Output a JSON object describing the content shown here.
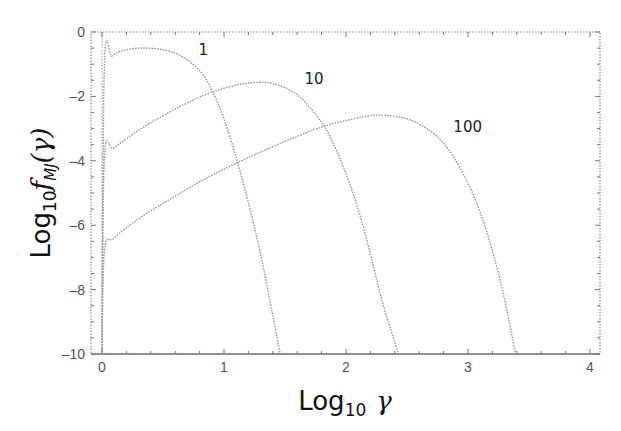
{
  "chart_data": {
    "type": "line",
    "title": "",
    "xlabel": "Log10 γ",
    "xlabel_parts": {
      "main": "Log",
      "sub": "10",
      "symbol": "γ"
    },
    "ylabel": "Log10 f_MJ(γ)",
    "ylabel_parts": {
      "main": "Log",
      "sub": "10",
      "func": "f",
      "func_sub": "MJ",
      "arg": "(γ)"
    },
    "xlim": [
      -0.1,
      4.1
    ],
    "ylim": [
      -10,
      0
    ],
    "xticks": [
      0,
      1,
      2,
      3,
      4
    ],
    "xtick_labels": [
      "0",
      "1",
      "2",
      "3",
      "4"
    ],
    "yticks": [
      0,
      -2,
      -4,
      -6,
      -8,
      -10
    ],
    "ytick_labels": [
      "0",
      "-2",
      "-4",
      "-6",
      "-8",
      "-10"
    ],
    "grid": false,
    "legend": "inline curve labels",
    "line_style": "dotted",
    "line_color": "#9a9a9a",
    "series": [
      {
        "name": "1",
        "label_pos": [
          0.79,
          -0.7
        ],
        "x": [
          0.0,
          0.02,
          0.08,
          0.15,
          0.25,
          0.35,
          0.5,
          0.65,
          0.8,
          0.9,
          1.0,
          1.1,
          1.2,
          1.3,
          1.4,
          1.46
        ],
        "y": [
          -10.0,
          -1.0,
          -0.75,
          -0.6,
          -0.52,
          -0.5,
          -0.55,
          -0.75,
          -1.2,
          -1.8,
          -2.7,
          -3.9,
          -5.3,
          -6.9,
          -8.8,
          -10.0
        ]
      },
      {
        "name": "10",
        "label_pos": [
          1.66,
          -1.6
        ],
        "x": [
          0.0,
          0.02,
          0.1,
          0.3,
          0.5,
          0.7,
          0.9,
          1.1,
          1.25,
          1.4,
          1.6,
          1.8,
          1.9,
          2.0,
          2.1,
          2.2,
          2.3,
          2.43
        ],
        "y": [
          -10.0,
          -3.9,
          -3.6,
          -3.05,
          -2.6,
          -2.2,
          -1.87,
          -1.65,
          -1.57,
          -1.6,
          -1.95,
          -2.8,
          -3.5,
          -4.4,
          -5.5,
          -6.9,
          -8.4,
          -10.0
        ]
      },
      {
        "name": "100",
        "label_pos": [
          2.88,
          -3.1
        ],
        "x": [
          0.0,
          0.02,
          0.1,
          0.3,
          0.6,
          0.9,
          1.2,
          1.5,
          1.8,
          2.0,
          2.25,
          2.5,
          2.7,
          2.85,
          3.0,
          3.1,
          3.2,
          3.3,
          3.39
        ],
        "y": [
          -10.0,
          -6.8,
          -6.4,
          -5.8,
          -5.1,
          -4.45,
          -3.9,
          -3.4,
          -2.95,
          -2.75,
          -2.58,
          -2.7,
          -3.1,
          -3.7,
          -4.7,
          -5.6,
          -6.8,
          -8.3,
          -10.0
        ]
      }
    ]
  }
}
